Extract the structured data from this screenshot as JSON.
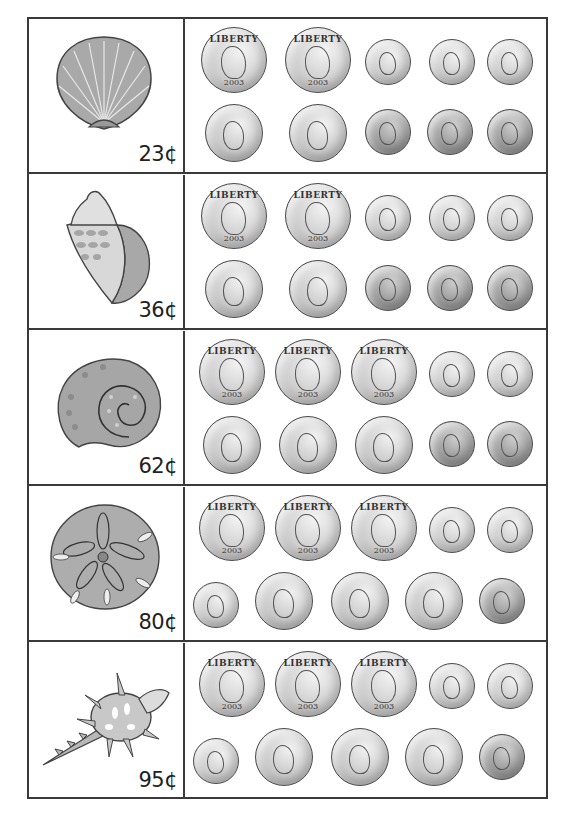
{
  "worksheet": {
    "rows": [
      {
        "shell": "scallop-shell",
        "price": "23¢",
        "coins": {
          "top": [
            "quarter",
            "quarter",
            "dime",
            "dime",
            "dime"
          ],
          "bottom": [
            "nickel",
            "nickel",
            "penny",
            "penny",
            "penny"
          ]
        }
      },
      {
        "shell": "conch-shell",
        "price": "36¢",
        "coins": {
          "top": [
            "quarter",
            "quarter",
            "dime",
            "dime",
            "dime"
          ],
          "bottom": [
            "nickel",
            "nickel",
            "penny",
            "penny",
            "penny"
          ]
        }
      },
      {
        "shell": "spiral-snail-shell",
        "price": "62¢",
        "coins": {
          "top": [
            "quarter",
            "quarter",
            "quarter",
            "dime",
            "dime"
          ],
          "bottom": [
            "nickel",
            "nickel",
            "nickel",
            "penny",
            "penny"
          ]
        }
      },
      {
        "shell": "sand-dollar",
        "price": "80¢",
        "coins": {
          "top": [
            "quarter",
            "quarter",
            "quarter",
            "dime",
            "dime"
          ],
          "bottom": [
            "dime",
            "nickel",
            "nickel",
            "nickel",
            "penny"
          ]
        }
      },
      {
        "shell": "spiky-murex-shell",
        "price": "95¢",
        "coins": {
          "top": [
            "quarter",
            "quarter",
            "quarter",
            "dime",
            "dime"
          ],
          "bottom": [
            "dime",
            "nickel",
            "nickel",
            "nickel",
            "penny"
          ]
        }
      }
    ],
    "coin_text": {
      "quarter_top": "LIBERTY",
      "quarter_year": "2003"
    }
  }
}
